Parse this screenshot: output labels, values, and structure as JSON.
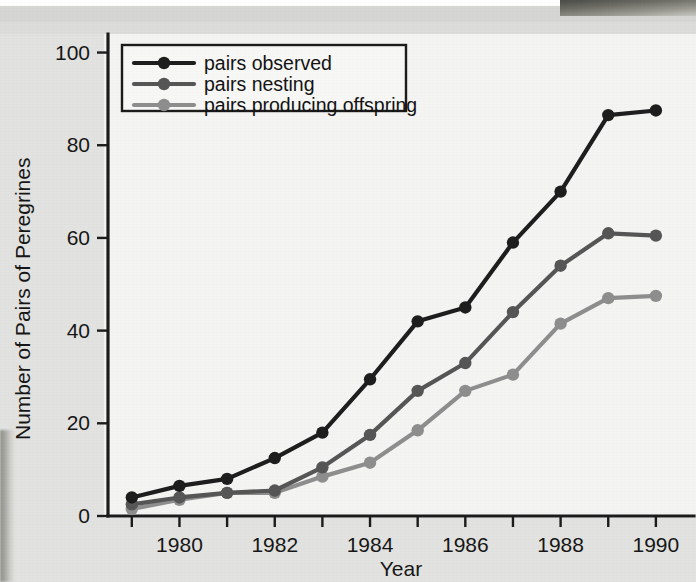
{
  "chart_data": {
    "type": "line",
    "title": "",
    "xlabel": "Year",
    "ylabel": "Number of Pairs of Peregrines",
    "x": [
      1979,
      1980,
      1981,
      1982,
      1983,
      1984,
      1985,
      1986,
      1987,
      1988,
      1989,
      1990
    ],
    "xtick_labels": [
      "1980",
      "1982",
      "1984",
      "1986",
      "1988",
      "1990"
    ],
    "xtick_values": [
      1980,
      1982,
      1984,
      1986,
      1988,
      1990
    ],
    "xlim": [
      1978.5,
      1990.8
    ],
    "ytick_labels": [
      "0",
      "20",
      "40",
      "60",
      "80",
      "100"
    ],
    "ytick_values": [
      0,
      20,
      40,
      60,
      80,
      100
    ],
    "ylim": [
      0,
      104
    ],
    "grid": false,
    "legend_position": "top-left",
    "series": [
      {
        "name": "pairs observed",
        "color": "#1e1e1e",
        "values": [
          4,
          6.5,
          8,
          12.5,
          18,
          29.5,
          42,
          45,
          59,
          70,
          86.5,
          87.5
        ]
      },
      {
        "name": "pairs nesting",
        "color": "#565656",
        "values": [
          2.5,
          4,
          5,
          5.5,
          10.5,
          17.5,
          27,
          33,
          44,
          54,
          61,
          60.5
        ]
      },
      {
        "name": "pairs producing offspring",
        "color": "#8e8e8e",
        "values": [
          1.5,
          3.5,
          5,
          5,
          8.5,
          11.5,
          18.5,
          27,
          30.5,
          41.5,
          47,
          47.5
        ]
      }
    ]
  }
}
